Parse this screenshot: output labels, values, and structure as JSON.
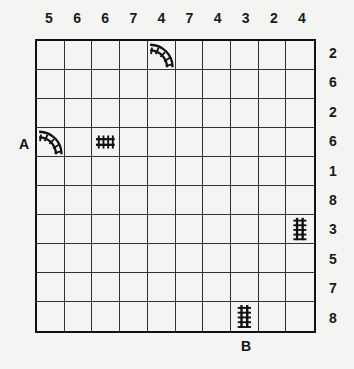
{
  "puzzle": {
    "type": "train-tracks",
    "size": 10,
    "column_clues": [
      "5",
      "6",
      "6",
      "7",
      "4",
      "7",
      "4",
      "3",
      "2",
      "4"
    ],
    "row_clues": [
      "2",
      "6",
      "2",
      "6",
      "1",
      "8",
      "3",
      "5",
      "7",
      "8"
    ],
    "start_label": "A",
    "end_label": "B",
    "start": {
      "row": 3,
      "col": 0,
      "side": "left"
    },
    "end": {
      "row": 9,
      "col": 7,
      "side": "bottom"
    },
    "given_pieces": [
      {
        "row": 0,
        "col": 4,
        "piece": "curve-west-south",
        "icon": "curved-track-icon"
      },
      {
        "row": 3,
        "col": 0,
        "piece": "curve-west-south",
        "icon": "curved-track-icon"
      },
      {
        "row": 3,
        "col": 2,
        "piece": "straight-horizontal",
        "icon": "straight-track-icon"
      },
      {
        "row": 6,
        "col": 9,
        "piece": "straight-vertical",
        "icon": "straight-track-icon"
      },
      {
        "row": 9,
        "col": 7,
        "piece": "straight-vertical",
        "icon": "straight-track-icon"
      }
    ],
    "colors": {
      "background": "#f4f4f2",
      "lines": "#111111",
      "track": "#111111"
    }
  }
}
